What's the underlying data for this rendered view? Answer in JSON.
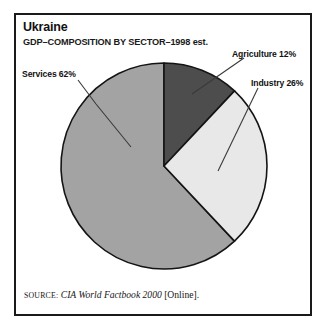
{
  "figure": {
    "title": "Ukraine",
    "subtitle": "GDP–COMPOSITION BY SECTOR–1998 est.",
    "source": {
      "prefix": "SOURCE:",
      "work": "CIA World Factbook 2000",
      "suffix": "[Online]."
    },
    "frame_color": "#1a1a1a",
    "background_color": "#ffffff"
  },
  "labels": {
    "services": "Services 62%",
    "agriculture": "Agriculture 12%",
    "industry": "Industry 26%"
  },
  "chart_data": {
    "type": "pie",
    "title": "Ukraine",
    "subtitle": "GDP–COMPOSITION BY SECTOR–1998 est.",
    "xlabel": "",
    "ylabel": "",
    "legend_position": "callout-labels",
    "grid": false,
    "start_angle_deg": 0,
    "direction": "clockwise",
    "units": "percent of GDP",
    "categories": [
      "Agriculture",
      "Industry",
      "Services"
    ],
    "values": [
      12,
      26,
      62
    ],
    "slices": [
      {
        "label": "Agriculture",
        "value": 12,
        "display_label": "Agriculture 12%",
        "color": "#4d4d4d",
        "start_angle_deg": 0,
        "end_angle_deg": 43.2
      },
      {
        "label": "Industry",
        "value": 26,
        "display_label": "Industry 26%",
        "color": "#e8e8e8",
        "start_angle_deg": 43.2,
        "end_angle_deg": 136.8
      },
      {
        "label": "Services",
        "value": 62,
        "display_label": "Services 62%",
        "color": "#a3a3a3",
        "start_angle_deg": 136.8,
        "end_angle_deg": 360
      }
    ],
    "total": 100,
    "annotations": [
      "Agriculture 12%",
      "Industry 26%",
      "Services 62%"
    ]
  }
}
